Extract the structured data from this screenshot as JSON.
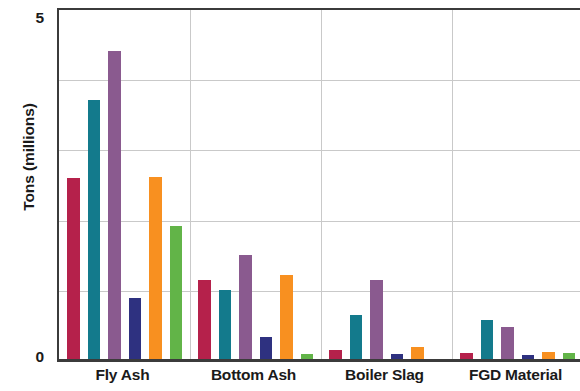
{
  "chart_data": {
    "type": "bar",
    "title": "",
    "xlabel": "",
    "ylabel": "Tons (millions)",
    "ylim": [
      0,
      5
    ],
    "ytick_labels": [
      "0",
      "5"
    ],
    "ytick_values": [
      0,
      5
    ],
    "gridlines_y": [
      1,
      2,
      3,
      4
    ],
    "grid": true,
    "legend_position": "none",
    "categories": [
      "Fly Ash",
      "Bottom Ash",
      "Boiler Slag",
      "FGD Material"
    ],
    "series": [
      {
        "name": "series-1",
        "color": "#b5214b",
        "values": [
          2.58,
          1.13,
          0.13,
          0.09
        ]
      },
      {
        "name": "series-2",
        "color": "#137a8c",
        "values": [
          3.69,
          0.99,
          0.62,
          0.56
        ]
      },
      {
        "name": "series-3",
        "color": "#8a5a8f",
        "values": [
          4.39,
          1.48,
          1.12,
          0.45
        ]
      },
      {
        "name": "series-4",
        "color": "#2e3180",
        "values": [
          0.87,
          0.32,
          0.07,
          0.06
        ]
      },
      {
        "name": "series-5",
        "color": "#f89020",
        "values": [
          2.59,
          1.19,
          0.17,
          0.1
        ]
      },
      {
        "name": "series-6",
        "color": "#62b448",
        "values": [
          1.89,
          0.07,
          0.0,
          0.09
        ]
      }
    ]
  },
  "axis": {
    "y_title": "Tons (millions)",
    "y_max_label": "5",
    "y_min_label": "0"
  },
  "categories": {
    "fly_ash": "Fly Ash",
    "bottom_ash": "Bottom Ash",
    "boiler_slag": "Boiler Slag",
    "fgd_material": "FGD Material"
  },
  "colors": {
    "crimson": "#b5214b",
    "teal": "#137a8c",
    "purple": "#8a5a8f",
    "navy": "#2e3180",
    "orange": "#f89020",
    "green": "#62b448",
    "axis": "#3b3b3b",
    "grid": "#c9c9c9",
    "text": "#1a1a1a"
  }
}
